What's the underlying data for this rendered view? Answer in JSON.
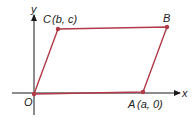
{
  "diagram": {
    "type": "parallelogram-on-axes",
    "axes": {
      "x_label": "x",
      "y_label": "y",
      "origin_label": "O"
    },
    "vertices": [
      {
        "name": "O",
        "label": "O",
        "coords_text": ""
      },
      {
        "name": "A",
        "label": "A",
        "coords_text": "(a, 0)"
      },
      {
        "name": "B",
        "label": "B",
        "coords_text": ""
      },
      {
        "name": "C",
        "label": "C",
        "coords_text": "(b, c)"
      }
    ],
    "colors": {
      "edge": "#b03a48",
      "point": "#b03a48",
      "axis": "#1a1a1a"
    }
  }
}
